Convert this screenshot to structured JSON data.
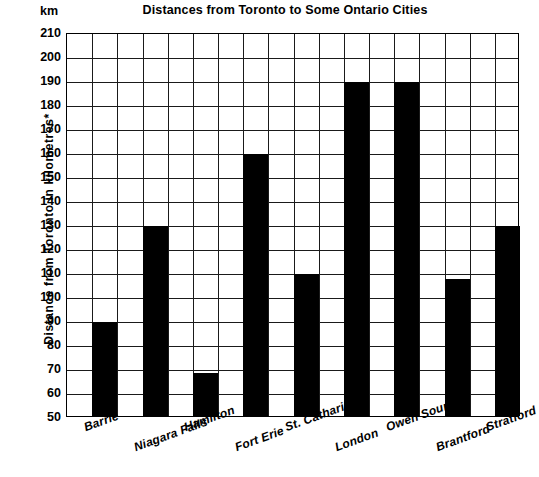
{
  "chart_data": {
    "type": "bar",
    "title": "Distances from Toronto to Some Ontario Cities",
    "unit_label": "km",
    "xlabel": "",
    "ylabel": "Distance from Toronto in kilometres*",
    "ylim": [
      50,
      210
    ],
    "ytick_step": 10,
    "ytick_labels": [
      "210",
      "200",
      "190",
      "180",
      "170",
      "160",
      "150",
      "140",
      "130",
      "120",
      "110",
      "100",
      "90",
      "80",
      "70",
      "60",
      "50"
    ],
    "grid": true,
    "legend": "none",
    "bar_color": "#000000",
    "categories": [
      "Barrie",
      "Niagara Falls",
      "Hamilton",
      "Fort Erie",
      "St. Catharines",
      "London",
      "Owen Sound",
      "Brantford",
      "Stratford"
    ],
    "values": [
      89,
      129,
      68,
      159,
      109,
      189,
      189,
      107,
      129
    ]
  }
}
